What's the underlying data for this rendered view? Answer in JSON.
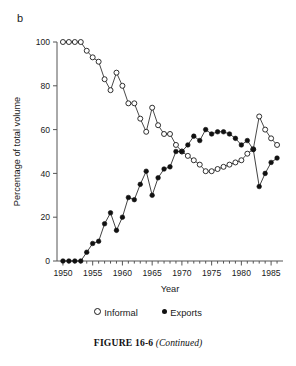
{
  "panel": {
    "label": "b"
  },
  "legend": {
    "position": "below-axis",
    "entries": [
      {
        "marker": "open-circle-marker",
        "label": "Informal"
      },
      {
        "marker": "filled-circle-marker",
        "label": "Exports"
      }
    ]
  },
  "caption": {
    "figure_number": "FIGURE 16-6",
    "note": "(Continued)"
  },
  "chart_data": {
    "type": "line",
    "title": "",
    "subtitle": "",
    "xlabel": "Year",
    "ylabel": "Percentage of total volume",
    "xlim": [
      1949,
      1987
    ],
    "ylim": [
      0,
      100
    ],
    "xticks": [
      1950,
      1955,
      1960,
      1965,
      1970,
      1975,
      1980,
      1985
    ],
    "xtick_labels": [
      "1950",
      "1955",
      "1960",
      "1965",
      "1970",
      "1975",
      "1980",
      "1985"
    ],
    "minor_xtick_interval": 1,
    "yticks": [
      0,
      20,
      40,
      60,
      80,
      100
    ],
    "ytick_labels": [
      "0",
      "20",
      "40",
      "60",
      "80",
      "100"
    ],
    "grid": false,
    "legend_position": "below",
    "x": [
      1950,
      1951,
      1952,
      1953,
      1954,
      1955,
      1956,
      1957,
      1958,
      1959,
      1960,
      1961,
      1962,
      1963,
      1964,
      1965,
      1966,
      1967,
      1968,
      1969,
      1970,
      1971,
      1972,
      1973,
      1974,
      1975,
      1976,
      1977,
      1978,
      1979,
      1980,
      1981,
      1982,
      1983,
      1984,
      1985,
      1986
    ],
    "series": [
      {
        "name": "Informal",
        "marker": "open-circle",
        "color": "#1a1a1a",
        "values": [
          100,
          100,
          100,
          100,
          96,
          93,
          91,
          83,
          78,
          86,
          80,
          72,
          72,
          65,
          59,
          70,
          62,
          58,
          58,
          53,
          50,
          48,
          46,
          44,
          41,
          41,
          42,
          43,
          44,
          45,
          46,
          49,
          51,
          66,
          60,
          56,
          53
        ]
      },
      {
        "name": "Exports",
        "marker": "filled-circle",
        "color": "#111111",
        "values": [
          0,
          0,
          0,
          0,
          4,
          8,
          9,
          17,
          22,
          14,
          20,
          29,
          28,
          35,
          41,
          30,
          38,
          42,
          43,
          50,
          50,
          53,
          57,
          55,
          60,
          58,
          59,
          59,
          58,
          56,
          53,
          55,
          51,
          34,
          40,
          45,
          47
        ]
      }
    ]
  }
}
